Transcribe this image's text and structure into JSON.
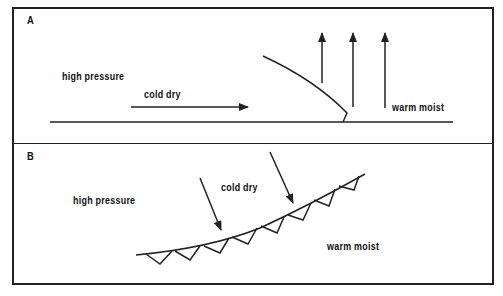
{
  "diagram": {
    "panels": [
      {
        "letter": "A",
        "labels": {
          "high_pressure": "high pressure",
          "cold_dry": "cold dry",
          "warm_moist": "warm moist"
        },
        "description": "Cold dry air moving horizontally under warm moist air; front boundary curves upward; warm air rising (three vertical arrows)"
      },
      {
        "letter": "B",
        "labels": {
          "high_pressure": "high pressure",
          "cold_dry": "cold dry",
          "warm_moist": "warm moist"
        },
        "description": "Plan view of a cold front line with triangular front symbols; cold dry air arrows descending toward the front"
      }
    ],
    "colors": {
      "ink": "#222222",
      "background": "#ffffff"
    }
  }
}
